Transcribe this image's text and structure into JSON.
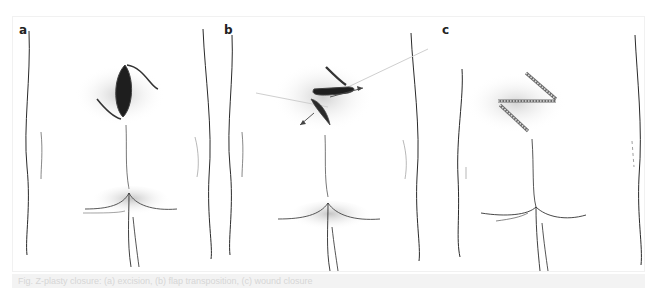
{
  "figure": {
    "panels": [
      {
        "label": "a",
        "description": "Midline sacrococcygeal wound with incision lines marked for flap"
      },
      {
        "label": "b",
        "description": "Flaps raised and transposed, arrows indicate direction of flap movement"
      },
      {
        "label": "c",
        "description": "Closed Z-shaped suture line after flap transposition"
      }
    ],
    "colors": {
      "line": "#2a2a2a",
      "shade": "#9a9a9a",
      "wound": "#1e1e1e",
      "caption_bg": "#f3f3f3",
      "caption_text": "#d6d6d6"
    }
  },
  "caption": {
    "text": "Fig. Z-plasty closure: (a) excision, (b) flap transposition, (c) wound closure"
  }
}
